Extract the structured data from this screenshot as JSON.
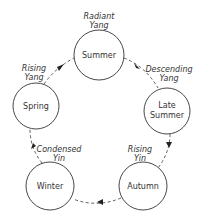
{
  "diagram": {
    "type": "cycle",
    "nodes": [
      {
        "id": "summer",
        "label_lines": [
          "Summer"
        ]
      },
      {
        "id": "late-summer",
        "label_lines": [
          "Late",
          "Summer"
        ]
      },
      {
        "id": "autumn",
        "label_lines": [
          "Autumn"
        ]
      },
      {
        "id": "winter",
        "label_lines": [
          "Winter"
        ]
      },
      {
        "id": "spring",
        "label_lines": [
          "Spring"
        ]
      }
    ],
    "phases": [
      {
        "lines": [
          "Radiant",
          "Yang"
        ]
      },
      {
        "lines": [
          "Descending",
          "Yang"
        ]
      },
      {
        "lines": [
          "Rising",
          "Yin"
        ]
      },
      {
        "lines": [
          "Condensed",
          "Yin"
        ]
      },
      {
        "lines": [
          "Rising",
          "Yang"
        ]
      }
    ],
    "edges": [
      {
        "from": "summer",
        "to": "late-summer"
      },
      {
        "from": "late-summer",
        "to": "autumn"
      },
      {
        "from": "autumn",
        "to": "winter"
      },
      {
        "from": "winter",
        "to": "spring"
      },
      {
        "from": "spring",
        "to": "summer"
      }
    ]
  }
}
